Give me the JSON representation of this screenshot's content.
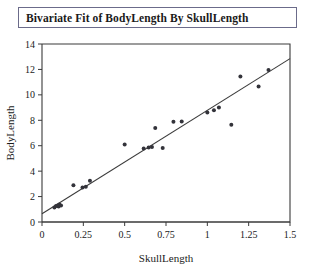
{
  "window": {
    "title": "Bivariate Fit of BodyLength By SkullLength"
  },
  "chart_data": {
    "type": "scatter",
    "title": "Bivariate Fit of BodyLength By SkullLength",
    "xlabel": "SkullLength",
    "ylabel": "BodyLength",
    "xlim": [
      0,
      1.5
    ],
    "ylim": [
      0,
      14
    ],
    "xticks": [
      0,
      0.25,
      0.5,
      0.75,
      1,
      1.25,
      1.5
    ],
    "xticklabels": [
      "0",
      "0.25",
      "0.5",
      "0.75",
      "1",
      "1.25",
      "1.5"
    ],
    "yticks": [
      0,
      2,
      4,
      6,
      8,
      10,
      12,
      14
    ],
    "yticklabels": [
      "0",
      "2",
      "4",
      "6",
      "8",
      "10",
      "12",
      "14"
    ],
    "grid": false,
    "legend": null,
    "marker": "filled-circle",
    "marker_color": "#33333a",
    "line_color": "#3a3a3a",
    "series": [
      {
        "name": "BodyLength vs SkullLength",
        "x": [
          0.075,
          0.085,
          0.095,
          0.1,
          0.105,
          0.115,
          0.19,
          0.245,
          0.265,
          0.29,
          0.5,
          0.615,
          0.645,
          0.665,
          0.685,
          0.73,
          0.795,
          0.845,
          1.0,
          1.04,
          1.07,
          1.145,
          1.2,
          1.31,
          1.37
        ],
        "y": [
          1.15,
          1.25,
          1.3,
          1.22,
          1.38,
          1.3,
          2.9,
          2.72,
          2.78,
          3.25,
          6.1,
          5.78,
          5.85,
          5.9,
          7.4,
          5.82,
          7.88,
          7.9,
          8.62,
          8.78,
          9.0,
          7.65,
          11.45,
          10.65,
          11.95
        ]
      }
    ],
    "fit_line": {
      "label": "linear fit",
      "x_start": 0.0,
      "y_start": 0.65,
      "x_end": 1.5,
      "y_end": 12.85
    }
  }
}
